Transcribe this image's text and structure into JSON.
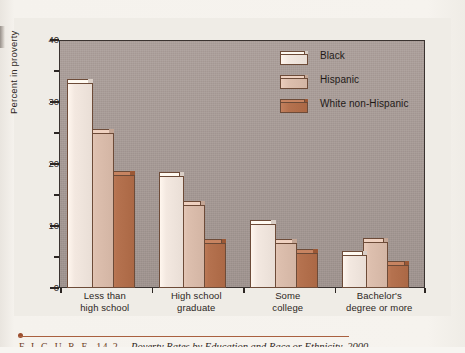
{
  "figure": {
    "label_prefix": "F I G U R E",
    "number": "14.2",
    "caption": "Poverty Rates by Education and Race or Ethnicity, 2000"
  },
  "colors": {
    "plot_background": "#a89b96",
    "page_background": "#f4f1ec",
    "axis": "#2c2623",
    "series_black": "#f3e8e0",
    "series_hispanic": "#ddbfae",
    "series_white_non_hispanic": "#b5724f",
    "bar_outline": "#6d4b38",
    "caption_rule": "#a9603f"
  },
  "chart_data": {
    "type": "bar",
    "title": "",
    "xlabel": "",
    "ylabel": "Percent in proverty",
    "ylim": [
      0,
      40
    ],
    "yticks": [
      0,
      10,
      20,
      30,
      40
    ],
    "ytick_labels": [
      "0",
      "10",
      "20",
      "30",
      "40"
    ],
    "yminor_ticks": [
      5,
      15,
      25,
      35
    ],
    "grid": false,
    "legend_position": "top-right",
    "categories": [
      "Less than\nhigh school",
      "High school\ngraduate",
      "Some\ncollege",
      "Bachelor's\ndegree or more"
    ],
    "category_lines": [
      [
        "Less than",
        "high school"
      ],
      [
        "High school",
        "graduate"
      ],
      [
        "Some",
        "college"
      ],
      [
        "Bachelor's",
        "degree or more"
      ]
    ],
    "series": [
      {
        "name": "Black",
        "color": "#f3e8e0",
        "values": [
          33.0,
          18.0,
          10.2,
          5.3
        ]
      },
      {
        "name": "Hispanic",
        "color": "#ddbfae",
        "values": [
          25.0,
          13.3,
          7.2,
          7.3
        ]
      },
      {
        "name": "White non-Hispanic",
        "color": "#b5724f",
        "values": [
          18.2,
          7.2,
          5.5,
          3.6
        ]
      }
    ]
  },
  "legend": {
    "items": [
      {
        "label": "Black",
        "color": "#f3e8e0"
      },
      {
        "label": "Hispanic",
        "color": "#ddbfae"
      },
      {
        "label": "White non-Hispanic",
        "color": "#b5724f"
      }
    ]
  }
}
